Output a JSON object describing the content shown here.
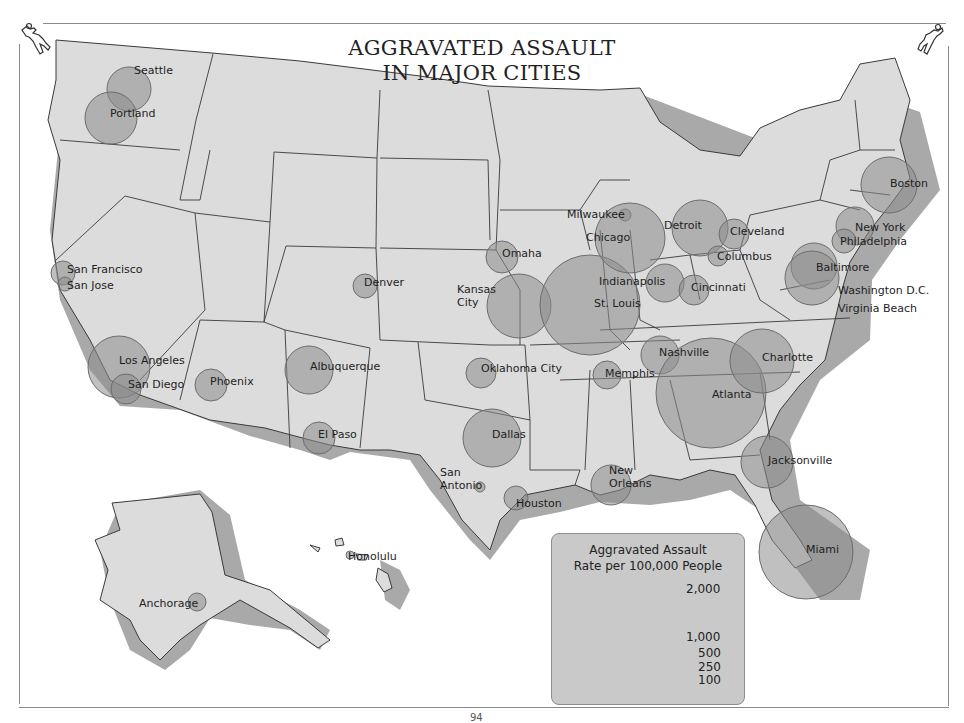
{
  "title": {
    "line1": "AGGRAVATED ASSAULT",
    "line2": "IN MAJOR CITIES"
  },
  "colors": {
    "land": "#dcdcdc",
    "shadow": "#a9a9a9",
    "border": "#3a3a3a",
    "bubble_fill": "#8c8c8c",
    "bubble_stroke": "#6d6d6d",
    "legend_bg": "#c9c9c9"
  },
  "icons": {
    "top_left": "chalk-outline-body-icon",
    "top_right": "chalk-outline-body-icon"
  },
  "cities": [
    {
      "name": "Seattle",
      "x": 129,
      "y": 89,
      "r": 22,
      "label_x": 134,
      "label_y": 64
    },
    {
      "name": "Portland",
      "x": 111,
      "y": 118,
      "r": 26,
      "label_x": 110,
      "label_y": 107
    },
    {
      "name": "San Francisco",
      "x": 63,
      "y": 273,
      "r": 12,
      "label_x": 67,
      "label_y": 263
    },
    {
      "name": "San Jose",
      "x": 65,
      "y": 284,
      "r": 7,
      "label_x": 67,
      "label_y": 279
    },
    {
      "name": "Los Angeles",
      "x": 119,
      "y": 367,
      "r": 31,
      "label_x": 119,
      "label_y": 354
    },
    {
      "name": "San Diego",
      "x": 126,
      "y": 389,
      "r": 15,
      "label_x": 128,
      "label_y": 378
    },
    {
      "name": "Phoenix",
      "x": 211,
      "y": 385,
      "r": 16,
      "label_x": 210,
      "label_y": 375
    },
    {
      "name": "Denver",
      "x": 365,
      "y": 286,
      "r": 12,
      "label_x": 364,
      "label_y": 276
    },
    {
      "name": "Albuquerque",
      "x": 309,
      "y": 370,
      "r": 24,
      "label_x": 310,
      "label_y": 360
    },
    {
      "name": "El Paso",
      "x": 319,
      "y": 438,
      "r": 16,
      "label_x": 318,
      "label_y": 428
    },
    {
      "name": "Omaha",
      "x": 502,
      "y": 257,
      "r": 16,
      "label_x": 502,
      "label_y": 247
    },
    {
      "name": "Kansas City",
      "x": 519,
      "y": 306,
      "r": 32,
      "label_x": 457,
      "label_y": 283
    },
    {
      "name": "St. Louis",
      "x": 590,
      "y": 305,
      "r": 50,
      "label_x": 594,
      "label_y": 297
    },
    {
      "name": "Oklahoma City",
      "x": 481,
      "y": 373,
      "r": 15,
      "label_x": 481,
      "label_y": 362
    },
    {
      "name": "Dallas",
      "x": 492,
      "y": 438,
      "r": 29,
      "label_x": 492,
      "label_y": 428
    },
    {
      "name": "San Antonio",
      "x": 480,
      "y": 487,
      "r": 5,
      "label_x": 440,
      "label_y": 466
    },
    {
      "name": "Houston",
      "x": 516,
      "y": 498,
      "r": 12,
      "label_x": 516,
      "label_y": 497
    },
    {
      "name": "New Orleans",
      "x": 611,
      "y": 485,
      "r": 20,
      "label_x": 609,
      "label_y": 464
    },
    {
      "name": "Memphis",
      "x": 607,
      "y": 375,
      "r": 14,
      "label_x": 605,
      "label_y": 367
    },
    {
      "name": "Milwaukee",
      "x": 625,
      "y": 215,
      "r": 6,
      "label_x": 567,
      "label_y": 208
    },
    {
      "name": "Chicago",
      "x": 630,
      "y": 238,
      "r": 35,
      "label_x": 586,
      "label_y": 231
    },
    {
      "name": "Indianapolis",
      "x": 665,
      "y": 283,
      "r": 19,
      "label_x": 599,
      "label_y": 275
    },
    {
      "name": "Detroit",
      "x": 700,
      "y": 228,
      "r": 28,
      "label_x": 664,
      "label_y": 219
    },
    {
      "name": "Cleveland",
      "x": 734,
      "y": 234,
      "r": 15,
      "label_x": 730,
      "label_y": 225
    },
    {
      "name": "Columbus",
      "x": 718,
      "y": 256,
      "r": 10,
      "label_x": 717,
      "label_y": 250
    },
    {
      "name": "Cincinnati",
      "x": 694,
      "y": 290,
      "r": 15,
      "label_x": 691,
      "label_y": 281
    },
    {
      "name": "Nashville",
      "x": 660,
      "y": 355,
      "r": 19,
      "label_x": 659,
      "label_y": 346
    },
    {
      "name": "Atlanta",
      "x": 711,
      "y": 393,
      "r": 55,
      "label_x": 712,
      "label_y": 388
    },
    {
      "name": "Charlotte",
      "x": 762,
      "y": 361,
      "r": 32,
      "label_x": 762,
      "label_y": 351
    },
    {
      "name": "Jacksonville",
      "x": 767,
      "y": 462,
      "r": 26,
      "label_x": 768,
      "label_y": 454
    },
    {
      "name": "Miami",
      "x": 806,
      "y": 552,
      "r": 47,
      "label_x": 806,
      "label_y": 543
    },
    {
      "name": "Boston",
      "x": 889,
      "y": 185,
      "r": 28,
      "label_x": 890,
      "label_y": 177
    },
    {
      "name": "New York",
      "x": 855,
      "y": 226,
      "r": 19,
      "label_x": 855,
      "label_y": 221
    },
    {
      "name": "Philadelphia",
      "x": 844,
      "y": 241,
      "r": 12,
      "label_x": 840,
      "label_y": 235
    },
    {
      "name": "Baltimore",
      "x": 814,
      "y": 266,
      "r": 23,
      "label_x": 816,
      "label_y": 261
    },
    {
      "name": "Washington D.C.",
      "x": 812,
      "y": 278,
      "r": 27,
      "label_x": 838,
      "label_y": 284
    },
    {
      "name": "Virginia Beach",
      "x": 835,
      "y": 312,
      "r": 0,
      "label_x": 838,
      "label_y": 302
    },
    {
      "name": "Anchorage",
      "x": 197,
      "y": 602,
      "r": 9,
      "label_x": 139,
      "label_y": 597
    },
    {
      "name": "Honolulu",
      "x": 350,
      "y": 555,
      "r": 4,
      "label_x": 348,
      "label_y": 550
    }
  ],
  "legend": {
    "title_line1": "Aggravated Assault",
    "title_line2": "Rate per 100,000 People",
    "items": [
      {
        "label": "2,000",
        "value": 2000
      },
      {
        "label": "1,000",
        "value": 1000
      },
      {
        "label": "500",
        "value": 500
      },
      {
        "label": "250",
        "value": 250
      },
      {
        "label": "100",
        "value": 100
      }
    ]
  },
  "page_number": "94",
  "chart_data": {
    "type": "proportional-symbol-map",
    "title": "AGGRAVATED ASSAULT IN MAJOR CITIES",
    "legend_title": "Aggravated Assault Rate per 100,000 People",
    "legend_values": [
      2000,
      1000,
      500,
      250,
      100
    ],
    "cities": [
      {
        "name": "Seattle",
        "rate_est": 340
      },
      {
        "name": "Portland",
        "rate_est": 470
      },
      {
        "name": "San Francisco",
        "rate_est": 100
      },
      {
        "name": "San Jose",
        "rate_est": 40
      },
      {
        "name": "Los Angeles",
        "rate_est": 670
      },
      {
        "name": "San Diego",
        "rate_est": 160
      },
      {
        "name": "Phoenix",
        "rate_est": 170
      },
      {
        "name": "Denver",
        "rate_est": 100
      },
      {
        "name": "Albuquerque",
        "rate_est": 400
      },
      {
        "name": "El Paso",
        "rate_est": 180
      },
      {
        "name": "Omaha",
        "rate_est": 170
      },
      {
        "name": "Kansas City",
        "rate_est": 720
      },
      {
        "name": "St. Louis",
        "rate_est": 1750
      },
      {
        "name": "Oklahoma City",
        "rate_est": 160
      },
      {
        "name": "Dallas",
        "rate_est": 590
      },
      {
        "name": "San Antonio",
        "rate_est": 20
      },
      {
        "name": "Houston",
        "rate_est": 100
      },
      {
        "name": "New Orleans",
        "rate_est": 280
      },
      {
        "name": "Memphis",
        "rate_est": 140
      },
      {
        "name": "Milwaukee",
        "rate_est": 30
      },
      {
        "name": "Chicago",
        "rate_est": 860
      },
      {
        "name": "Indianapolis",
        "rate_est": 250
      },
      {
        "name": "Detroit",
        "rate_est": 550
      },
      {
        "name": "Cleveland",
        "rate_est": 160
      },
      {
        "name": "Columbus",
        "rate_est": 70
      },
      {
        "name": "Cincinnati",
        "rate_est": 160
      },
      {
        "name": "Nashville",
        "rate_est": 250
      },
      {
        "name": "Atlanta",
        "rate_est": 2100
      },
      {
        "name": "Charlotte",
        "rate_est": 720
      },
      {
        "name": "Jacksonville",
        "rate_est": 470
      },
      {
        "name": "Miami",
        "rate_est": 1550
      },
      {
        "name": "Boston",
        "rate_est": 550
      },
      {
        "name": "New York",
        "rate_est": 250
      },
      {
        "name": "Philadelphia",
        "rate_est": 100
      },
      {
        "name": "Baltimore",
        "rate_est": 370
      },
      {
        "name": "Washington D.C.",
        "rate_est": 500
      },
      {
        "name": "Virginia Beach",
        "rate_est": 0
      },
      {
        "name": "Anchorage",
        "rate_est": 60
      },
      {
        "name": "Honolulu",
        "rate_est": 15
      }
    ]
  }
}
